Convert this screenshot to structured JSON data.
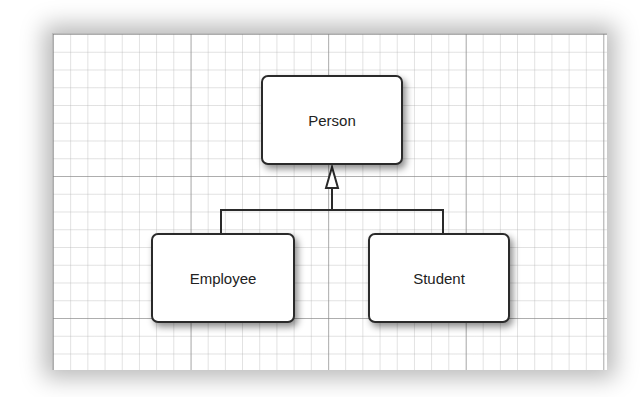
{
  "diagram": {
    "type": "uml-inheritance",
    "nodes": [
      {
        "id": "person",
        "label": "Person"
      },
      {
        "id": "employee",
        "label": "Employee"
      },
      {
        "id": "student",
        "label": "Student"
      }
    ],
    "edges": [
      {
        "from": "employee",
        "to": "person",
        "kind": "generalization"
      },
      {
        "from": "student",
        "to": "person",
        "kind": "generalization"
      }
    ],
    "colors": {
      "box_border": "#2a2a2a",
      "grid": "#bbbbbb",
      "background": "#ffffff"
    }
  }
}
